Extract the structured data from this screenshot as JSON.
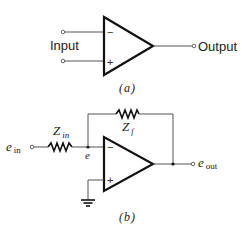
{
  "diagram_a": {
    "input_label": "Input",
    "output_label": "Output",
    "minus_sign": "−",
    "plus_sign": "+",
    "caption": "(a)"
  },
  "diagram_b": {
    "ein_main": "e",
    "ein_sub": "in",
    "zin_main": "Z",
    "zin_sub": "in",
    "zf_main": "Z",
    "zf_sub": "f",
    "node_label": "e",
    "eout_main": "e",
    "eout_sub": "out",
    "minus_sign": "−",
    "plus_sign": "+",
    "caption": "(b)"
  },
  "colors": {
    "line": "#111111",
    "wire": "#555555",
    "background": "#ffffff"
  }
}
